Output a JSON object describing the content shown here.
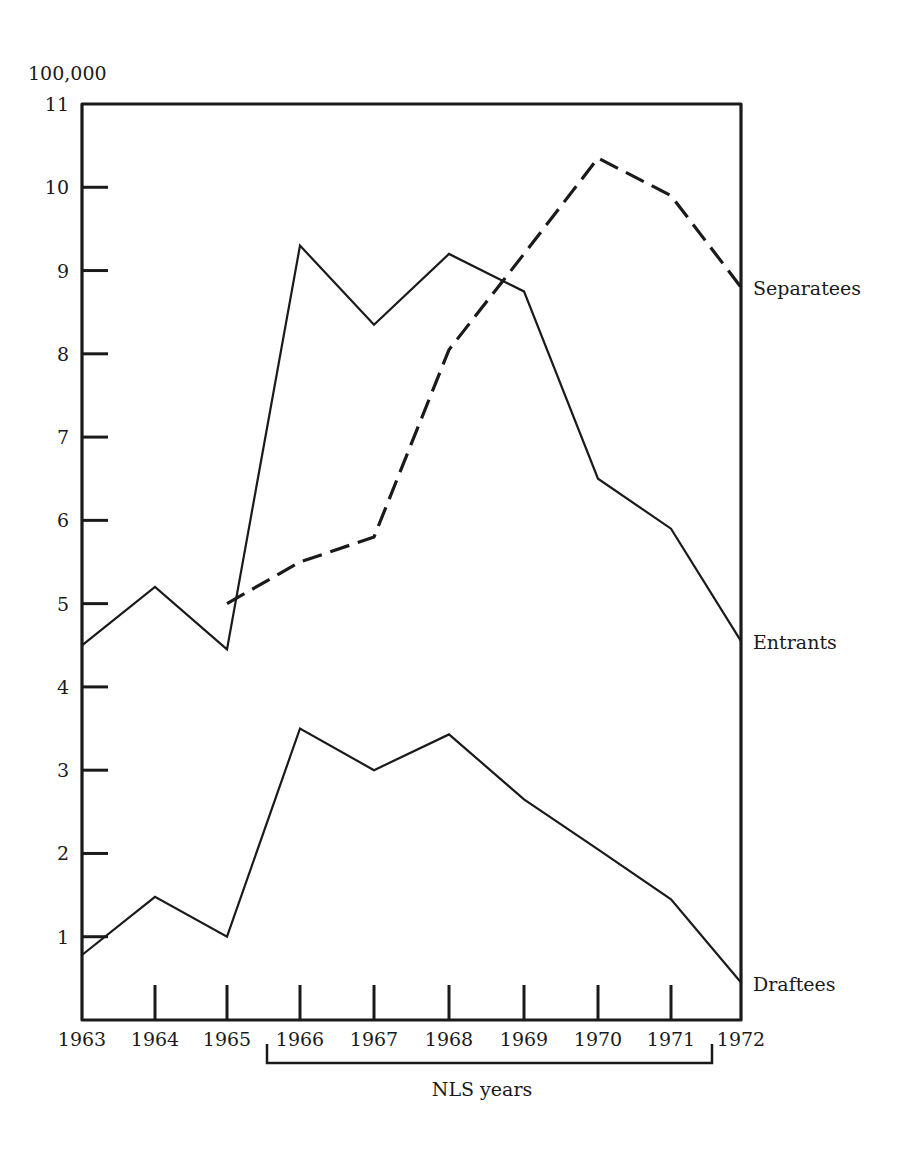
{
  "chart_data": {
    "type": "line",
    "title": "",
    "unit_label": "100,000",
    "xlabel": "",
    "ylabel": "100,000",
    "x": [
      1963,
      1964,
      1965,
      1966,
      1967,
      1968,
      1969,
      1970,
      1971,
      1972
    ],
    "x_tick_labels": [
      "1963",
      "1964",
      "1965",
      "1966",
      "1967",
      "1968",
      "1969",
      "1970",
      "1971",
      "1972"
    ],
    "y_ticks": [
      1,
      2,
      3,
      4,
      5,
      6,
      7,
      8,
      9,
      10,
      11
    ],
    "y_tick_labels": [
      "1",
      "2",
      "3",
      "4",
      "5",
      "6",
      "7",
      "8",
      "9",
      "10",
      "11"
    ],
    "ylim": [
      0,
      11
    ],
    "grid": false,
    "legend_position": "right, inline series labels",
    "series": [
      {
        "name": "Separatees",
        "style": "dashed",
        "values": [
          null,
          null,
          5.0,
          5.5,
          5.8,
          8.05,
          9.2,
          10.35,
          9.9,
          8.8
        ]
      },
      {
        "name": "Entrants",
        "style": "solid",
        "values": [
          4.5,
          5.2,
          4.45,
          9.3,
          8.35,
          9.2,
          8.75,
          6.5,
          5.9,
          4.55
        ]
      },
      {
        "name": "Draftees",
        "style": "solid",
        "values": [
          0.78,
          1.48,
          1.0,
          3.5,
          3.0,
          3.43,
          2.65,
          2.05,
          1.45,
          0.45
        ]
      }
    ],
    "annotations": [
      {
        "text": "NLS years",
        "type": "bracket",
        "x_from": 1965.55,
        "x_to": 1971.55
      }
    ]
  },
  "labels": {
    "unit": "100,000",
    "bracket": "NLS years"
  },
  "colors": {
    "ink": "#1a1a1a",
    "background": "#ffffff"
  }
}
